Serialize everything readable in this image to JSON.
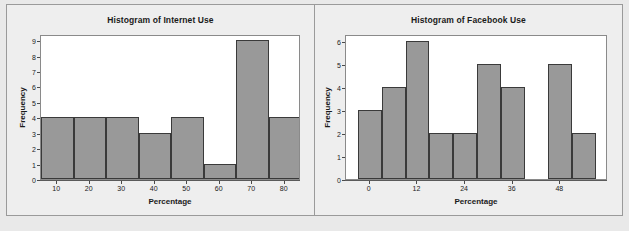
{
  "figure": {
    "background_color": "#e9e9e9",
    "panel_background_color": "#eeeeee",
    "plot_background_color": "#ffffff",
    "bar_fill_color": "#999999",
    "bar_edge_color": "#3a3a3a",
    "frame_color": "#9a9a9a"
  },
  "chart_data": [
    {
      "type": "bar",
      "title": "Histogram of Internet Use",
      "xlabel": "Percentage",
      "ylabel": "Frequency",
      "grid": false,
      "legend": "none",
      "xlim": [
        5,
        85
      ],
      "ylim": [
        0,
        9.4
      ],
      "bin_width": 10,
      "bin_edges": [
        5,
        15,
        25,
        35,
        45,
        55,
        65,
        75,
        85
      ],
      "bin_centers": [
        10,
        20,
        30,
        40,
        50,
        60,
        70,
        80
      ],
      "values": [
        4,
        4,
        4,
        3,
        4,
        1,
        9,
        4
      ],
      "xticks": [
        10,
        20,
        30,
        40,
        50,
        60,
        70,
        80
      ],
      "xtick_labels": [
        "10",
        "20",
        "30",
        "40",
        "50",
        "60",
        "70",
        "80"
      ],
      "yticks": [
        0,
        1,
        2,
        3,
        4,
        5,
        6,
        7,
        8,
        9
      ],
      "ytick_labels": [
        "0",
        "1",
        "2",
        "3",
        "4",
        "5",
        "6",
        "7",
        "8",
        "9"
      ]
    },
    {
      "type": "bar",
      "title": "Histogram of Facebook Use",
      "xlabel": "Percentage",
      "ylabel": "Frequency",
      "grid": false,
      "legend": "none",
      "xlim": [
        -6,
        60
      ],
      "ylim": [
        0,
        6.3
      ],
      "bin_width": 6,
      "bin_edges": [
        -3,
        3,
        9,
        15,
        21,
        27,
        33,
        39,
        45,
        51,
        57
      ],
      "bin_centers": [
        0,
        6,
        12,
        18,
        24,
        30,
        36,
        42,
        48,
        54
      ],
      "values": [
        3,
        4,
        6,
        2,
        2,
        5,
        4,
        0,
        5,
        2
      ],
      "xticks": [
        0,
        12,
        24,
        36,
        48
      ],
      "xtick_labels": [
        "0",
        "12",
        "24",
        "36",
        "48"
      ],
      "yticks": [
        0,
        1,
        2,
        3,
        4,
        5,
        6
      ],
      "ytick_labels": [
        "0",
        "1",
        "2",
        "3",
        "4",
        "5",
        "6"
      ]
    }
  ]
}
